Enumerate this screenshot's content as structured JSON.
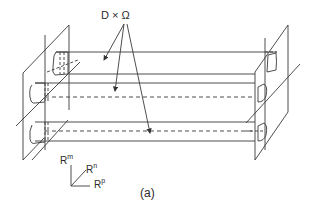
{
  "figure": {
    "label": "(a)",
    "annotation": "D × Ω",
    "axes": {
      "m": {
        "base": "R",
        "sup": "m"
      },
      "n": {
        "base": "R",
        "sup": "n"
      },
      "p": {
        "base": "R",
        "sup": "p"
      }
    }
  },
  "colors": {
    "line": "#3a3a3a",
    "background": "#ffffff"
  }
}
